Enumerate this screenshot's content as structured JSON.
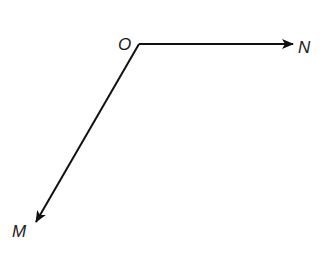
{
  "diagram": {
    "points": {
      "O": {
        "label": "O",
        "x": 139,
        "y": 44
      },
      "N": {
        "label": "N",
        "x": 293,
        "y": 44
      },
      "M": {
        "label": "M",
        "x": 36,
        "y": 222
      }
    },
    "rays": [
      {
        "name": "ray-ON",
        "from": "O",
        "to": "N"
      },
      {
        "name": "ray-OM",
        "from": "O",
        "to": "M"
      }
    ],
    "colors": {
      "stroke": "#111111",
      "label": "#222222",
      "background": "#ffffff"
    }
  }
}
